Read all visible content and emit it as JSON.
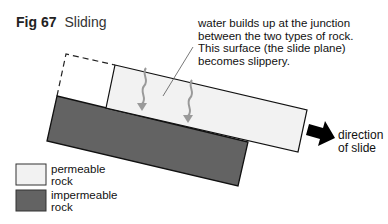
{
  "figure": {
    "number": "Fig 67",
    "title": "Sliding"
  },
  "annotation": {
    "lines": [
      "water builds up at the junction",
      "between the two types of rock.",
      "This surface (the slide plane)",
      "becomes slippery."
    ]
  },
  "direction_label": {
    "line1": "direction",
    "line2": "of slide"
  },
  "legend": {
    "items": [
      {
        "label_line1": "permeable",
        "label_line2": "rock",
        "color": "#f2f2f2"
      },
      {
        "label_line1": "impermeable",
        "label_line2": "rock",
        "color": "#636363"
      }
    ]
  },
  "colors": {
    "permeable": "#f2f2f2",
    "impermeable": "#636363",
    "water_arrow": "#9a9a9a",
    "outline": "#111111"
  }
}
